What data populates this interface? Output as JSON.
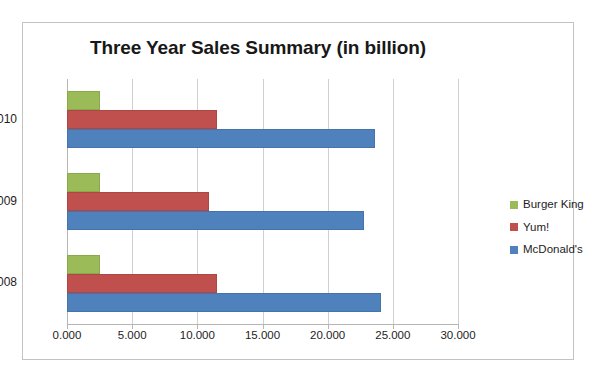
{
  "chart_data": {
    "type": "bar",
    "orientation": "horizontal",
    "title": "Three Year Sales Summary (in billion)",
    "xlabel": "",
    "ylabel": "",
    "categories": [
      "2010",
      "2009",
      "2008"
    ],
    "series": [
      {
        "name": "Burger King",
        "color": "#9BBB59",
        "values": [
          2.5,
          2.5,
          2.5
        ]
      },
      {
        "name": "Yum!",
        "color": "#C0504D",
        "values": [
          11.5,
          10.9,
          11.5
        ]
      },
      {
        "name": "McDonald's",
        "color": "#4F81BD",
        "values": [
          23.6,
          22.8,
          24.1
        ]
      }
    ],
    "xlim": [
      0,
      30
    ],
    "xticks": [
      0,
      5,
      10,
      15,
      20,
      25,
      30
    ],
    "xtick_labels": [
      "0.000",
      "5.000",
      "10.000",
      "15.000",
      "20.000",
      "25.000",
      "30.000"
    ],
    "grid": true,
    "grid_axis": "x",
    "legend_position": "right",
    "legend_order": [
      "Burger King",
      "Yum!",
      "McDonald's"
    ]
  },
  "colors": {
    "burger_king": "#9BBB59",
    "yum": "#C0504D",
    "mcdonalds": "#4F81BD",
    "gridline": "#d0d0d0",
    "axis": "#b6b6b6",
    "frame_border": "#c3c3c3",
    "text": "#1d1d1d",
    "background": "#ffffff"
  }
}
